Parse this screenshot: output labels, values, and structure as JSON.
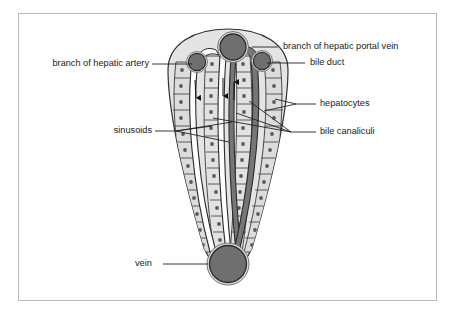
{
  "figure": {
    "frame": {
      "x": 18,
      "y": 13,
      "width": 419,
      "height": 288,
      "border_color": "#b9b9b9"
    },
    "background_color": "#ffffff"
  },
  "palette": {
    "vessel_fill": "#6f6f6f",
    "vessel_outline": "#2b2b2b",
    "vessel_ring": "#d8d8d8",
    "cell_fill": "#d9d9d9",
    "cell_fill_light": "#e6e6e6",
    "cell_outline": "#3a3a3a",
    "nucleus_fill": "#5a5a5a",
    "sinusoid_fill": "#ffffff",
    "sinusoid_outline": "#2b2b2b",
    "canaliculi_fill": "#767676",
    "canaliculi_outline": "#2b2b2b",
    "lobule_body_fill": "#e2e2e2",
    "leader_color": "#222222",
    "text_color": "#1a1a1a"
  },
  "labels": [
    {
      "id": "branch-of-hepatic-portal-vein",
      "text": "branch of hepatic portal vein",
      "text_x": 283,
      "text_y": 47,
      "anchor": "start",
      "leader": "M 278 47 L 252 47"
    },
    {
      "id": "bile-duct",
      "text": "bile duct",
      "text_x": 310,
      "text_y": 63,
      "anchor": "start",
      "leader": "M 305 63 L 267 63"
    },
    {
      "id": "branch-of-hepatic-artery",
      "text": "branch of hepatic artery",
      "text_x": 149,
      "text_y": 64,
      "anchor": "end",
      "leader": "M 152 64 L 192 64"
    },
    {
      "id": "hepatocytes",
      "text": "hepatocytes",
      "text_x": 320,
      "text_y": 104,
      "anchor": "start",
      "leader": "M 316 104 L 296 104 M 296 104 L 264 111 M 296 104 L 275 99"
    },
    {
      "id": "bile-canaliculi",
      "text": "bile canaliculi",
      "text_x": 320,
      "text_y": 132,
      "anchor": "start",
      "leader": "M 316 132 L 291 132 M 291 132 L 249 101 M 291 132 L 236 113 M 291 132 L 213 118"
    },
    {
      "id": "sinusoids",
      "text": "sinusoids",
      "text_x": 152,
      "text_y": 131,
      "anchor": "end",
      "leader": "M 155 131 L 176 131 M 176 131 L 232 122 M 176 131 L 229 142 M 176 131 L 212 126"
    },
    {
      "id": "vein",
      "text": "vein",
      "text_x": 135,
      "text_y": 264,
      "anchor": "start",
      "leader": "M 163 264 L 208 264"
    }
  ],
  "structures": {
    "lobule_outline_name": "lobule-body",
    "portal_vein": {
      "cx": 233,
      "cy": 47,
      "r": 14.5,
      "label": "branch of hepatic portal vein"
    },
    "hepatic_artery": {
      "cx": 198,
      "cy": 62,
      "r": 9.5,
      "label": "branch of hepatic artery"
    },
    "bile_duct_vessel": {
      "cx": 262,
      "cy": 62,
      "r": 9.5,
      "label": "bile duct"
    },
    "central_vein": {
      "cx": 228,
      "cy": 264,
      "r": 20,
      "label": "vein"
    },
    "sinusoid_count": 2,
    "canaliculi_count": 2,
    "hepatocyte_columns": 4
  }
}
